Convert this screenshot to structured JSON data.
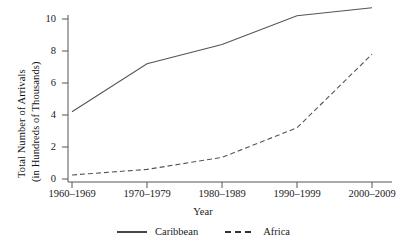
{
  "chart_data": {
    "type": "line",
    "title": "",
    "xlabel": "Year",
    "ylabel_line1": "Total Number of Arrivals",
    "ylabel_line2": "(in Hundreds of Thousands)",
    "categories": [
      "1960–1969",
      "1970–1979",
      "1980–1989",
      "1990–1999",
      "2000–2009"
    ],
    "yticks": [
      "0",
      "2",
      "4",
      "6",
      "8",
      "10"
    ],
    "ytick_values": [
      0,
      2,
      4,
      6,
      8,
      10
    ],
    "ylim": [
      0,
      11
    ],
    "grid": false,
    "legend_position": "bottom",
    "series": [
      {
        "name": "Caribbean",
        "style": "solid",
        "color": "#555555",
        "values": [
          4.2,
          7.2,
          8.4,
          10.2,
          10.7
        ]
      },
      {
        "name": "Africa",
        "style": "dashed",
        "color": "#555555",
        "values": [
          0.25,
          0.6,
          1.35,
          3.2,
          7.8
        ]
      }
    ]
  },
  "axis": {
    "spine_color": "#555555"
  }
}
